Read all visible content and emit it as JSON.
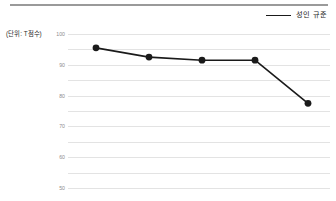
{
  "figure": {
    "unit_label": "(단위: T점수)",
    "top_rule_color": "#9a9a9a"
  },
  "legend": {
    "position": "top-right",
    "entries": [
      {
        "label": "성인 규준",
        "color": "#1a1a1a",
        "marker": "line"
      }
    ]
  },
  "chart_data": {
    "type": "line",
    "title": "",
    "subtitle": "",
    "xlabel": "",
    "ylabel": "(단위: T점수)",
    "ylim": [
      0,
      100
    ],
    "yticks": [
      100,
      90,
      80,
      70,
      60,
      50,
      40,
      30,
      20,
      10,
      0
    ],
    "ytick_labels": [
      "100",
      "90",
      "80",
      "70",
      "60",
      "50",
      "40",
      "30",
      "20",
      "10",
      "0"
    ],
    "grid": true,
    "grid_axis": "y",
    "grid_color": "#e3e3e3",
    "legend_position": "top-right",
    "x": [
      1,
      2,
      3,
      4,
      5
    ],
    "xtick_labels": [
      "",
      "",
      "",
      "",
      ""
    ],
    "series": [
      {
        "name": "성인 규준",
        "color": "#1a1a1a",
        "marker": "circle",
        "values": [
          91,
          85,
          83,
          83,
          55
        ]
      }
    ]
  }
}
